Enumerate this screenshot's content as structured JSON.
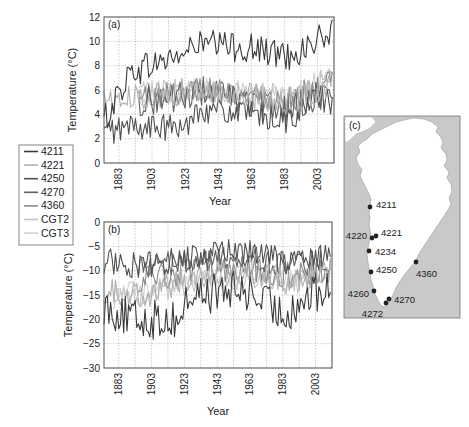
{
  "chart_data": [
    {
      "id": "a",
      "panel_label": "(a)",
      "type": "line",
      "title": "",
      "xlabel": "Year",
      "ylabel": "Temperature (°C)",
      "xlim": [
        1874,
        2013
      ],
      "ylim": [
        0,
        12
      ],
      "yticks": [
        0,
        2,
        4,
        6,
        8,
        10,
        12
      ],
      "xticks": [
        1883,
        1903,
        1923,
        1943,
        1963,
        1983,
        2003
      ],
      "grid": true,
      "series": [
        {
          "name": "4211",
          "color": "#3a3a3a",
          "start": 1874,
          "end": 2012,
          "mean_profile": [
            [
              1874,
              3.5
            ],
            [
              1890,
              7.5
            ],
            [
              1923,
              9.0
            ],
            [
              1930,
              9.8
            ],
            [
              1960,
              9.5
            ],
            [
              1985,
              8.8
            ],
            [
              2000,
              9.8
            ],
            [
              2012,
              10.8
            ]
          ],
          "amplitude": 0.9
        },
        {
          "name": "4221",
          "color": "#b0b0b0",
          "start": 1874,
          "end": 2012,
          "mean_profile": [
            [
              1874,
              5.5
            ],
            [
              1880,
              5.0
            ],
            [
              1900,
              5.5
            ],
            [
              1930,
              6.0
            ],
            [
              1960,
              5.5
            ],
            [
              1985,
              5.0
            ],
            [
              2012,
              6.5
            ]
          ],
          "amplitude": 0.8
        },
        {
          "name": "4250",
          "color": "#505050",
          "start": 1874,
          "end": 2012,
          "mean_profile": [
            [
              1874,
              2.5
            ],
            [
              1890,
              3.0
            ],
            [
              1923,
              2.8
            ],
            [
              1930,
              4.5
            ],
            [
              1960,
              4.0
            ],
            [
              1985,
              3.5
            ],
            [
              2005,
              5.5
            ],
            [
              2012,
              4.5
            ]
          ],
          "amplitude": 0.8
        },
        {
          "name": "4270",
          "color": "#606060",
          "start": 1895,
          "end": 2012,
          "mean_profile": [
            [
              1895,
              5.0
            ],
            [
              1923,
              5.5
            ],
            [
              1935,
              6.0
            ],
            [
              1960,
              5.0
            ],
            [
              1985,
              4.5
            ],
            [
              2012,
              6.0
            ]
          ],
          "amplitude": 0.9
        },
        {
          "name": "4360",
          "color": "#8a8a8a",
          "start": 1895,
          "end": 2012,
          "mean_profile": [
            [
              1895,
              5.5
            ],
            [
              1923,
              5.8
            ],
            [
              1935,
              6.2
            ],
            [
              1960,
              5.5
            ],
            [
              1985,
              5.2
            ],
            [
              2012,
              6.5
            ]
          ],
          "amplitude": 0.8
        },
        {
          "name": "CGT2",
          "color": "#c4c4c4",
          "start": 1895,
          "end": 2012,
          "mean_profile": [
            [
              1895,
              5.8
            ],
            [
              1930,
              6.0
            ],
            [
              1960,
              5.8
            ],
            [
              1985,
              5.5
            ],
            [
              2012,
              7.0
            ]
          ],
          "amplitude": 0.7
        },
        {
          "name": "CGT3",
          "color": "#d2d2d2",
          "start": 1895,
          "end": 2012,
          "mean_profile": [
            [
              1895,
              5.6
            ],
            [
              1930,
              6.1
            ],
            [
              1960,
              5.6
            ],
            [
              1985,
              5.4
            ],
            [
              2012,
              7.2
            ]
          ],
          "amplitude": 0.7
        }
      ]
    },
    {
      "id": "b",
      "panel_label": "(b)",
      "type": "line",
      "title": "",
      "xlabel": "Year",
      "ylabel": "Temperature (°C)",
      "xlim": [
        1874,
        2013
      ],
      "ylim": [
        -30,
        0
      ],
      "yticks": [
        -30,
        -25,
        -20,
        -15,
        -10,
        -5,
        0
      ],
      "xticks": [
        1883,
        1903,
        1923,
        1943,
        1963,
        1983,
        2003
      ],
      "grid": true,
      "series": [
        {
          "name": "4211",
          "color": "#3a3a3a",
          "start": 1874,
          "end": 2012,
          "mean_profile": [
            [
              1874,
              -17
            ],
            [
              1890,
              -20
            ],
            [
              1920,
              -20
            ],
            [
              1926,
              -15
            ],
            [
              1960,
              -14
            ],
            [
              1983,
              -19
            ],
            [
              2000,
              -15
            ],
            [
              2012,
              -14
            ]
          ],
          "amplitude": 3.0
        },
        {
          "name": "4221",
          "color": "#b0b0b0",
          "start": 1874,
          "end": 2012,
          "mean_profile": [
            [
              1874,
              -14
            ],
            [
              1900,
              -15
            ],
            [
              1930,
              -11
            ],
            [
              1960,
              -10
            ],
            [
              1985,
              -12
            ],
            [
              2012,
              -10
            ]
          ],
          "amplitude": 2.0
        },
        {
          "name": "4250",
          "color": "#505050",
          "start": 1874,
          "end": 2012,
          "mean_profile": [
            [
              1874,
              -8
            ],
            [
              1900,
              -9
            ],
            [
              1930,
              -7
            ],
            [
              1960,
              -6
            ],
            [
              1985,
              -8
            ],
            [
              2012,
              -7
            ]
          ],
          "amplitude": 2.0
        },
        {
          "name": "4270",
          "color": "#606060",
          "start": 1895,
          "end": 2012,
          "mean_profile": [
            [
              1895,
              -9
            ],
            [
              1930,
              -8
            ],
            [
              1960,
              -7
            ],
            [
              1985,
              -9
            ],
            [
              2012,
              -8
            ]
          ],
          "amplitude": 1.8
        },
        {
          "name": "4360",
          "color": "#8a8a8a",
          "start": 1895,
          "end": 2012,
          "mean_profile": [
            [
              1895,
              -12
            ],
            [
              1930,
              -10
            ],
            [
              1960,
              -9
            ],
            [
              1985,
              -11
            ],
            [
              2012,
              -10
            ]
          ],
          "amplitude": 2.0
        },
        {
          "name": "CGT2",
          "color": "#c4c4c4",
          "start": 1880,
          "end": 2012,
          "mean_profile": [
            [
              1880,
              -16
            ],
            [
              1910,
              -14
            ],
            [
              1935,
              -12
            ],
            [
              1960,
              -12
            ],
            [
              1985,
              -13
            ],
            [
              2012,
              -11
            ]
          ],
          "amplitude": 1.6
        },
        {
          "name": "CGT3",
          "color": "#d2d2d2",
          "start": 1880,
          "end": 2012,
          "mean_profile": [
            [
              1880,
              -15
            ],
            [
              1910,
              -13
            ],
            [
              1935,
              -11
            ],
            [
              1960,
              -11
            ],
            [
              1985,
              -12
            ],
            [
              2012,
              -10
            ]
          ],
          "amplitude": 1.6
        }
      ]
    }
  ],
  "legend": {
    "items": [
      {
        "label": "4211",
        "color": "#3a3a3a"
      },
      {
        "label": "4221",
        "color": "#b0b0b0"
      },
      {
        "label": "4250",
        "color": "#505050"
      },
      {
        "label": "4270",
        "color": "#606060"
      },
      {
        "label": "4360",
        "color": "#8a8a8a"
      },
      {
        "label": "CGT2",
        "color": "#c4c4c4"
      },
      {
        "label": "CGT3",
        "color": "#d2d2d2"
      }
    ]
  },
  "map": {
    "panel_label": "(c)",
    "stations": [
      {
        "label": "4211",
        "x": 370,
        "y": 207,
        "lx": 376,
        "ly": 205,
        "anchor": "start"
      },
      {
        "label": "4220",
        "x": 372,
        "y": 238,
        "lx": 367,
        "ly": 236,
        "anchor": "end"
      },
      {
        "label": "4221",
        "x": 376,
        "y": 236,
        "lx": 381,
        "ly": 233,
        "anchor": "start"
      },
      {
        "label": "4234",
        "x": 369,
        "y": 251,
        "lx": 375,
        "ly": 252,
        "anchor": "start"
      },
      {
        "label": "4250",
        "x": 371,
        "y": 272,
        "lx": 376,
        "ly": 270,
        "anchor": "start"
      },
      {
        "label": "4360",
        "x": 416,
        "y": 262,
        "lx": 416,
        "ly": 274,
        "anchor": "start"
      },
      {
        "label": "4260",
        "x": 374,
        "y": 291,
        "lx": 369,
        "ly": 294,
        "anchor": "end"
      },
      {
        "label": "4270",
        "x": 389,
        "y": 299,
        "lx": 394,
        "ly": 300,
        "anchor": "start"
      },
      {
        "label": "4272",
        "x": 386,
        "y": 303,
        "lx": 383,
        "ly": 314,
        "anchor": "end"
      }
    ]
  }
}
